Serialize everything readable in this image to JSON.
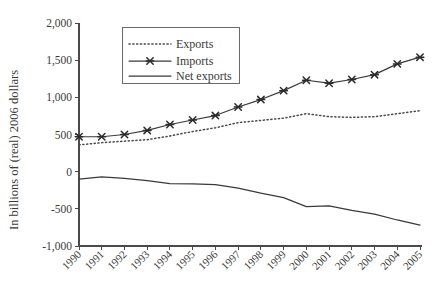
{
  "chart_data": {
    "type": "line",
    "title": "",
    "xlabel": "",
    "ylabel": "In billions of (real) 2006 dollars",
    "categories": [
      "1990",
      "1991",
      "1992",
      "1993",
      "1994",
      "1995",
      "1996",
      "1997",
      "1998",
      "1999",
      "2000",
      "2001",
      "2002",
      "2003",
      "2004",
      "2005"
    ],
    "ylim": [
      -1000,
      2000
    ],
    "ytick_values": [
      2000,
      1500,
      1000,
      500,
      0,
      -500,
      -1000
    ],
    "ytick_labels": [
      "2,000",
      "1,500",
      "1,000",
      "500",
      "0",
      "-500",
      "-1,000"
    ],
    "grid": false,
    "legend_position": "upper-left-center",
    "series": [
      {
        "name": "Exports",
        "style": "dotted",
        "marker": "none",
        "color": "#4a4a4a",
        "values": [
          360,
          390,
          410,
          430,
          480,
          540,
          590,
          660,
          690,
          720,
          780,
          740,
          730,
          740,
          780,
          820
        ]
      },
      {
        "name": "Imports",
        "style": "solid",
        "marker": "x",
        "color": "#3a3a3a",
        "values": [
          470,
          470,
          500,
          555,
          635,
          695,
          755,
          870,
          970,
          1090,
          1230,
          1190,
          1240,
          1305,
          1450,
          1540
        ]
      },
      {
        "name": "Net exports",
        "style": "solid",
        "marker": "none",
        "color": "#3a3a3a",
        "values": [
          -100,
          -70,
          -90,
          -120,
          -160,
          -165,
          -175,
          -220,
          -290,
          -350,
          -470,
          -460,
          -520,
          -570,
          -650,
          -720
        ]
      }
    ]
  },
  "legend": {
    "entries": [
      {
        "label": "Exports"
      },
      {
        "label": "Imports"
      },
      {
        "label": "Net exports"
      }
    ]
  },
  "axes": {
    "y_title": "In billions of (real) 2006 dollars"
  }
}
